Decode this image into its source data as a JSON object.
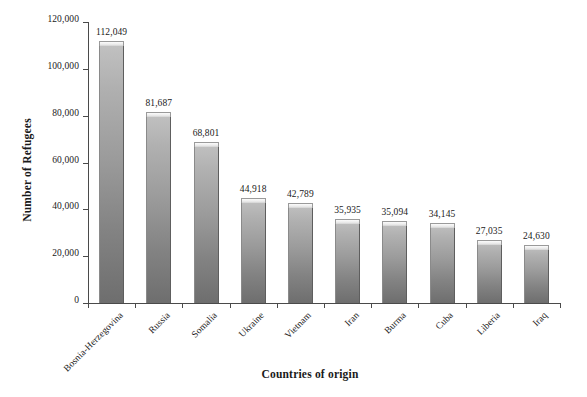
{
  "chart_data": {
    "type": "bar",
    "title": "",
    "xlabel": "Countries of origin",
    "ylabel": "Number of Refugees",
    "ylim": [
      0,
      120000
    ],
    "ytick_labels": [
      "0",
      "20,000",
      "40,000",
      "60,000",
      "80,000",
      "100,000",
      "120,000"
    ],
    "ytick_values": [
      0,
      20000,
      40000,
      60000,
      80000,
      100000,
      120000
    ],
    "grid": false,
    "legend": "none",
    "categories": [
      "Bosnia-Herzegovina",
      "Russia",
      "Somalia",
      "Ukraine",
      "Vietnam",
      "Iran",
      "Burma",
      "Cuba",
      "Liberia",
      "Iraq"
    ],
    "values": [
      112049,
      81687,
      68801,
      44918,
      42789,
      35935,
      35094,
      34145,
      27035,
      24630
    ],
    "value_labels": [
      "112,049",
      "81,687",
      "68,801",
      "44,918",
      "42,789",
      "35,935",
      "35,094",
      "34,145",
      "27,035",
      "24,630"
    ],
    "bar_color_top": "#c2c2c2",
    "bar_color_bottom": "#6e6e6e",
    "axis_color": "#4a4a4a",
    "background": "#ffffff"
  }
}
